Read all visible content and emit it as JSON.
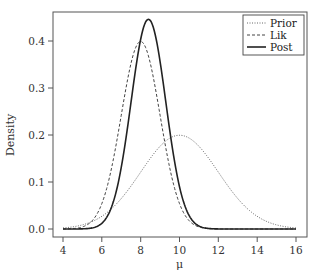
{
  "chart_data": {
    "type": "line",
    "title": "",
    "xlabel": "μ",
    "ylabel": "Density",
    "xlim": [
      4,
      16
    ],
    "ylim": [
      0,
      0.45
    ],
    "xticks": [
      4,
      6,
      8,
      10,
      12,
      14,
      16
    ],
    "xtick_labels": [
      "4",
      "6",
      "8",
      "10",
      "12",
      "14",
      "16"
    ],
    "yticks": [
      0.0,
      0.1,
      0.2,
      0.3,
      0.4
    ],
    "ytick_labels": [
      "0.0",
      "0.1",
      "0.2",
      "0.3",
      "0.4"
    ],
    "grid": false,
    "legend_position": "top-right",
    "series": [
      {
        "name": "Prior",
        "distribution": "normal",
        "mean": 10,
        "sd": 2,
        "peak_density": 0.199,
        "line_style": "dotted",
        "color": "#555555"
      },
      {
        "name": "Lik",
        "distribution": "normal",
        "mean": 8,
        "sd": 1,
        "peak_density": 0.399,
        "line_style": "dashed",
        "color": "#444444"
      },
      {
        "name": "Post",
        "distribution": "normal",
        "mean": 8.4,
        "sd": 0.894,
        "peak_density": 0.446,
        "line_style": "solid",
        "color": "#222222"
      }
    ]
  },
  "legend": {
    "items": [
      {
        "label": "Prior",
        "style": "dotted"
      },
      {
        "label": "Lik",
        "style": "dashed"
      },
      {
        "label": "Post",
        "style": "solid"
      }
    ]
  },
  "axes": {
    "xlabel": "μ",
    "ylabel": "Density",
    "xtick_labels": [
      "4",
      "6",
      "8",
      "10",
      "12",
      "14",
      "16"
    ],
    "ytick_labels": [
      "0.0",
      "0.1",
      "0.2",
      "0.3",
      "0.4"
    ]
  }
}
